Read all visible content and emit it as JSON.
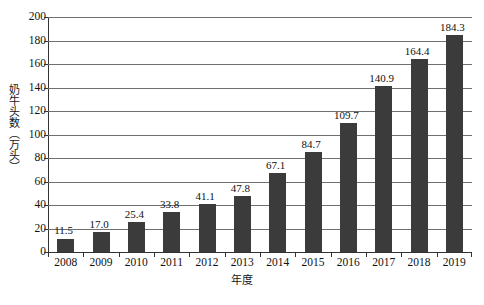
{
  "chart_data": {
    "type": "bar",
    "title": "",
    "subtitle": "",
    "xlabel": "年度",
    "ylabel": "奶牛头数（万头）",
    "categories": [
      "2008",
      "2009",
      "2010",
      "2011",
      "2012",
      "2013",
      "2014",
      "2015",
      "2016",
      "2017",
      "2018",
      "2019"
    ],
    "values": [
      11.5,
      17.0,
      25.4,
      33.8,
      41.1,
      47.8,
      67.1,
      84.7,
      109.7,
      140.9,
      164.4,
      184.3
    ],
    "value_labels": [
      "11.5",
      "17.0",
      "25.4",
      "33.8",
      "41.1",
      "47.8",
      "67.1",
      "84.7",
      "109.7",
      "140.9",
      "164.4",
      "184.3"
    ],
    "ylim": [
      0,
      200
    ],
    "ytick_values": [
      0,
      20,
      40,
      60,
      80,
      100,
      120,
      140,
      160,
      180,
      200
    ],
    "ytick_labels": [
      "0",
      "20",
      "40",
      "60",
      "80",
      "100",
      "120",
      "140",
      "160",
      "180",
      "200"
    ],
    "grid": true,
    "grid_axis": "y",
    "legend": false,
    "legend_position": "none",
    "bar_color": "#3b3b3b",
    "gridline_color": "#6f6f6f",
    "axis_color": "#333333",
    "background_color": "#ffffff",
    "series": [
      {
        "name": "奶牛头数",
        "values": [
          11.5,
          17.0,
          25.4,
          33.8,
          41.1,
          47.8,
          67.1,
          84.7,
          109.7,
          140.9,
          164.4,
          184.3
        ]
      }
    ]
  }
}
